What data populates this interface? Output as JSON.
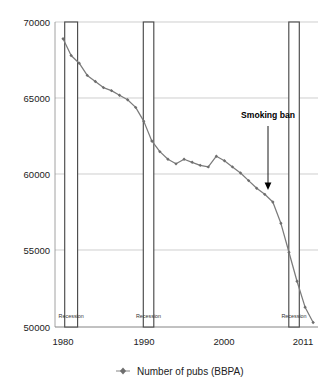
{
  "chart_data": {
    "type": "line",
    "title": "",
    "subtitle": "",
    "xlabel": "",
    "ylabel": "",
    "xlim": [
      1979,
      2011.6
    ],
    "ylim": [
      50000,
      70000
    ],
    "grid": true,
    "legend_position": "bottom",
    "x_ticks": [
      "1980",
      "1990",
      "2000",
      "2011"
    ],
    "x_tick_values": [
      1980,
      1990,
      2000,
      2011
    ],
    "y_ticks": [
      "50000",
      "55000",
      "60000",
      "65000",
      "70000"
    ],
    "y_tick_values": [
      50000,
      55000,
      60000,
      65000,
      70000
    ],
    "series": [
      {
        "name": "Number of pubs (BBPA)",
        "color": "#7b7b7b",
        "marker": "diamond",
        "x": [
          1980,
          1981,
          1982,
          1983,
          1984,
          1985,
          1986,
          1987,
          1988,
          1989,
          1990,
          1991,
          1992,
          1993,
          1994,
          1995,
          1996,
          1997,
          1998,
          1999,
          2000,
          2001,
          2002,
          2003,
          2004,
          2005,
          2006,
          2007,
          2008,
          2009,
          2010,
          2011
        ],
        "values": [
          68900,
          67800,
          67300,
          66500,
          66100,
          65700,
          65500,
          65200,
          64900,
          64400,
          63500,
          62200,
          61500,
          61000,
          60700,
          61000,
          60800,
          60600,
          60500,
          61200,
          60900,
          60500,
          60100,
          59600,
          59100,
          58700,
          58200,
          56800,
          54900,
          53000,
          51300,
          50300
        ]
      }
    ],
    "annotations": [
      {
        "name": "smoking-ban",
        "label": "Smoking ban",
        "x": 2007,
        "label_y": 63200,
        "arrow_tip_y": 59300
      }
    ],
    "bands": [
      {
        "name": "recession-1",
        "label": "Recession",
        "x_start": 1980.2,
        "x_end": 1981.8
      },
      {
        "name": "recession-2",
        "label": "Recession",
        "x_start": 1990.0,
        "x_end": 1991.3
      },
      {
        "name": "recession-3",
        "label": "Recession",
        "x_start": 2008.1,
        "x_end": 2009.4
      }
    ],
    "legend": [
      {
        "label": "Number of pubs (BBPA)",
        "color": "#7b7b7b"
      }
    ]
  }
}
